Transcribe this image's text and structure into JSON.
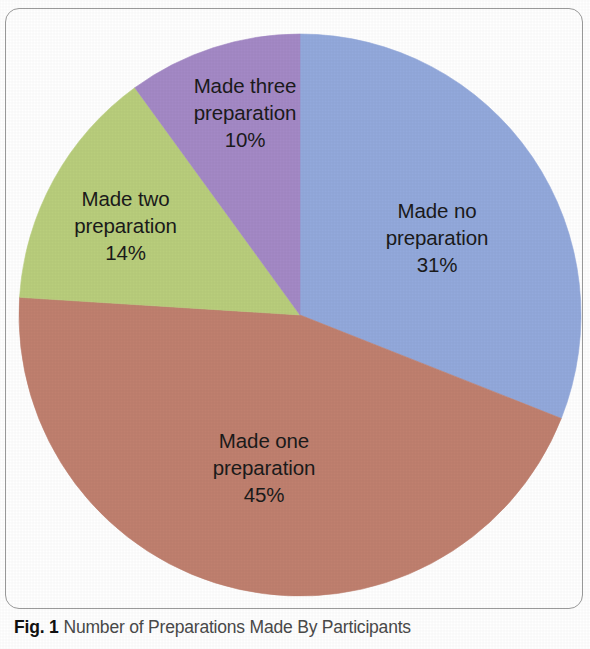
{
  "caption": {
    "figure_number": "Fig. 1",
    "text": "Number of Preparations Made By Participants"
  },
  "chart_data": {
    "type": "pie",
    "title": "Number of Preparations Made By Participants",
    "xlabel": "",
    "ylabel": "",
    "start_angle_deg": 0,
    "direction": "clockwise",
    "legend": "none",
    "grid": false,
    "labels_inside_slices": true,
    "categories": [
      "Made no preparation",
      "Made one preparation",
      "Made two preparation",
      "Made three preparation"
    ],
    "values": [
      31,
      45,
      14,
      10
    ],
    "value_unit": "%",
    "colors": [
      "#93a9dc",
      "#c0806f",
      "#b9ce7c",
      "#a489c6"
    ],
    "slices": [
      {
        "label": "Made no preparation",
        "value": 31,
        "value_text": "31%",
        "color": "#93a9dc",
        "color_name": "blue",
        "label_lines": [
          "Made no",
          "preparation"
        ]
      },
      {
        "label": "Made one preparation",
        "value": 45,
        "value_text": "45%",
        "color": "#c0806f",
        "color_name": "brown",
        "label_lines": [
          "Made one",
          "preparation"
        ]
      },
      {
        "label": "Made two preparation",
        "value": 14,
        "value_text": "14%",
        "color": "#b9ce7c",
        "color_name": "green",
        "label_lines": [
          "Made two",
          "preparation"
        ]
      },
      {
        "label": "Made three preparation",
        "value": 10,
        "value_text": "10%",
        "color": "#a489c6",
        "color_name": "purple",
        "label_lines": [
          "Made three",
          "preparation"
        ]
      }
    ]
  }
}
